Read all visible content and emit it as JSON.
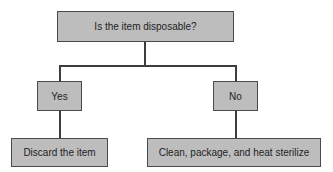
{
  "diagram": {
    "type": "decision-tree",
    "root": {
      "label": "Is the item disposable?"
    },
    "branches": [
      {
        "label": "Yes",
        "outcome": "Discard the item"
      },
      {
        "label": "No",
        "outcome": "Clean, package, and heat sterilize"
      }
    ]
  },
  "colors": {
    "box_fill": "#bdbdbd",
    "box_border": "#4a4a4a",
    "connector": "#3d3d3d"
  }
}
